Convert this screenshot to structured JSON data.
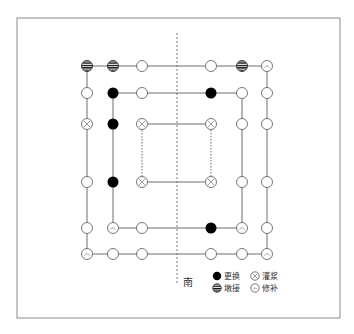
{
  "diagram": {
    "frame": {
      "x": 17,
      "y": 18,
      "w": 323,
      "h": 300,
      "stroke": "#8a8a8a"
    },
    "axis_line": {
      "x": 177,
      "y1": 33,
      "y2": 284,
      "label": "南"
    },
    "columns_x": [
      87,
      113,
      142,
      211,
      242,
      267
    ],
    "rows_y": [
      66,
      93,
      124,
      182,
      228,
      254
    ],
    "rings": [
      {
        "name": "outer",
        "x1": 87,
        "y1": 66,
        "x2": 267,
        "y2": 254,
        "dash_sides": false
      },
      {
        "name": "middle",
        "x1": 113,
        "y1": 93,
        "x2": 242,
        "y2": 228,
        "dash_sides": false
      },
      {
        "name": "inner",
        "x1": 142,
        "y1": 124,
        "x2": 211,
        "y2": 182,
        "dash_sides": true
      }
    ],
    "colors": {
      "line": "#6e6e6e",
      "marker_stroke": "#555555",
      "fill_dark": "#000000"
    },
    "columns": [
      {
        "x": 87,
        "y": 66,
        "type": "dunjie"
      },
      {
        "x": 113,
        "y": 66,
        "type": "dunjie"
      },
      {
        "x": 142,
        "y": 66,
        "type": "plain"
      },
      {
        "x": 211,
        "y": 66,
        "type": "plain"
      },
      {
        "x": 242,
        "y": 66,
        "type": "dunjie"
      },
      {
        "x": 267,
        "y": 66,
        "type": "xiubu"
      },
      {
        "x": 87,
        "y": 93,
        "type": "plain"
      },
      {
        "x": 113,
        "y": 93,
        "type": "genghuan"
      },
      {
        "x": 142,
        "y": 93,
        "type": "plain"
      },
      {
        "x": 211,
        "y": 93,
        "type": "genghuan"
      },
      {
        "x": 242,
        "y": 93,
        "type": "plain"
      },
      {
        "x": 267,
        "y": 93,
        "type": "plain"
      },
      {
        "x": 87,
        "y": 124,
        "type": "guanjiang"
      },
      {
        "x": 113,
        "y": 124,
        "type": "genghuan"
      },
      {
        "x": 142,
        "y": 124,
        "type": "guanjiang"
      },
      {
        "x": 211,
        "y": 124,
        "type": "guanjiang"
      },
      {
        "x": 242,
        "y": 124,
        "type": "plain"
      },
      {
        "x": 267,
        "y": 124,
        "type": "plain"
      },
      {
        "x": 87,
        "y": 182,
        "type": "plain"
      },
      {
        "x": 113,
        "y": 182,
        "type": "genghuan"
      },
      {
        "x": 142,
        "y": 182,
        "type": "guanjiang"
      },
      {
        "x": 211,
        "y": 182,
        "type": "guanjiang"
      },
      {
        "x": 242,
        "y": 182,
        "type": "plain"
      },
      {
        "x": 267,
        "y": 182,
        "type": "plain"
      },
      {
        "x": 87,
        "y": 228,
        "type": "plain"
      },
      {
        "x": 113,
        "y": 228,
        "type": "xiubu"
      },
      {
        "x": 142,
        "y": 228,
        "type": "plain"
      },
      {
        "x": 211,
        "y": 228,
        "type": "genghuan"
      },
      {
        "x": 242,
        "y": 228,
        "type": "xiubu"
      },
      {
        "x": 267,
        "y": 228,
        "type": "plain"
      },
      {
        "x": 87,
        "y": 254,
        "type": "xiubu"
      },
      {
        "x": 113,
        "y": 254,
        "type": "plain"
      },
      {
        "x": 142,
        "y": 254,
        "type": "plain"
      },
      {
        "x": 211,
        "y": 254,
        "type": "plain"
      },
      {
        "x": 242,
        "y": 254,
        "type": "plain"
      },
      {
        "x": 267,
        "y": 254,
        "type": "xiubu"
      }
    ],
    "legend": [
      {
        "type": "genghuan",
        "label": "更换",
        "x": 217,
        "y": 276
      },
      {
        "type": "guanjiang",
        "label": "灌浆",
        "x": 255,
        "y": 276
      },
      {
        "type": "dunjie",
        "label": "墩接",
        "x": 217,
        "y": 288
      },
      {
        "type": "xiubu",
        "label": "修补",
        "x": 255,
        "y": 288
      }
    ],
    "marker_icons": {
      "genghuan": "filled-circle-icon",
      "dunjie": "striped-circle-icon",
      "guanjiang": "cross-circle-icon",
      "xiubu": "patched-circle-icon",
      "plain": "empty-circle-icon"
    }
  }
}
